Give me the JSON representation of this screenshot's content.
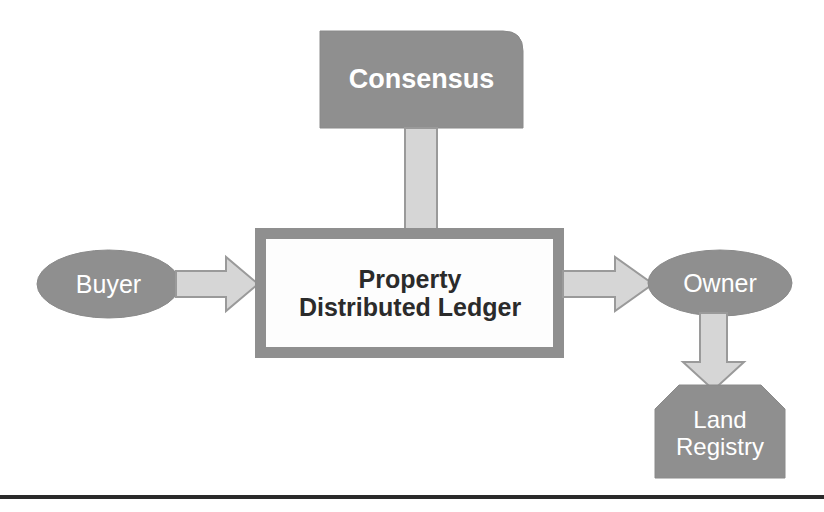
{
  "diagram": {
    "colors": {
      "node_fill_gray": "#8f8f8f",
      "node_stroke_gray": "#8a8a8a",
      "arrow_fill": "#d6d6d6",
      "arrow_stroke": "#9a9a9a",
      "center_box_fill": "#ffffff",
      "center_box_border": "#8f8f8f",
      "label_light": "#ffffff",
      "label_dark": "#2b2b2b",
      "rule_color": "#2a2a2a",
      "background": "#ffffff"
    },
    "nodes": [
      {
        "id": "consensus",
        "label": "Consensus",
        "shape": "rounded-top-right-rectangle",
        "fill": "gray",
        "text_color": "white"
      },
      {
        "id": "buyer",
        "label": "Buyer",
        "shape": "ellipse",
        "fill": "gray",
        "text_color": "white"
      },
      {
        "id": "ledger",
        "label_line1": "Property",
        "label_line2": "Distributed Ledger",
        "label": "Property Distributed Ledger",
        "shape": "thick-bordered-rectangle",
        "fill": "white",
        "text_color": "dark"
      },
      {
        "id": "owner",
        "label": "Owner",
        "shape": "ellipse",
        "fill": "gray",
        "text_color": "white"
      },
      {
        "id": "land-registry",
        "label_line1": "Land",
        "label_line2": "Registry",
        "label": "Land Registry",
        "shape": "beveled-top-corners-rectangle",
        "fill": "gray",
        "text_color": "white"
      }
    ],
    "arrows": [
      {
        "id": "consensus-to-ledger",
        "from": "consensus",
        "to": "ledger",
        "direction": "down",
        "style": "block-arrow"
      },
      {
        "id": "buyer-to-ledger",
        "from": "buyer",
        "to": "ledger",
        "direction": "right",
        "style": "block-arrow"
      },
      {
        "id": "ledger-to-owner",
        "from": "ledger",
        "to": "owner",
        "direction": "right",
        "style": "block-arrow"
      },
      {
        "id": "owner-to-land-registry",
        "from": "owner",
        "to": "land-registry",
        "direction": "down",
        "style": "block-arrow"
      }
    ],
    "footer_rule": {
      "id": "bottom-rule",
      "visible": true
    }
  }
}
